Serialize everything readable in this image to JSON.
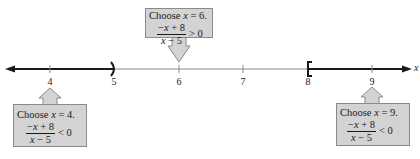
{
  "number_line": {
    "variable": "x",
    "ticks": [
      {
        "value": "4",
        "x": 50
      },
      {
        "value": "5",
        "x": 114
      },
      {
        "value": "6",
        "x": 179
      },
      {
        "value": "7",
        "x": 243
      },
      {
        "value": "8",
        "x": 308
      },
      {
        "value": "9",
        "x": 372
      }
    ],
    "solution": [
      {
        "interval": "(-∞, 5)",
        "endpoint": "5",
        "endpoint_type": "open parenthesis"
      },
      {
        "interval": "[8, ∞)",
        "endpoint": "8",
        "endpoint_type": "closed bracket"
      }
    ],
    "colors": {
      "axis": "#8a8a8a",
      "shaded": "#1a1a1a",
      "callout_fill": "#d3d3d3",
      "callout_border": "#8a8a8a"
    }
  },
  "callouts": [
    {
      "id": "test-6",
      "choose_prefix": "Choose ",
      "var": "x",
      "choose_suffix": " = 6.",
      "numerator_prefix": "−",
      "numerator_var": "x",
      "numerator_suffix": " + 8",
      "denominator_var": "x",
      "denominator_suffix": " − 5",
      "relation": "> 0"
    },
    {
      "id": "test-4",
      "choose_prefix": "Choose ",
      "var": "x",
      "choose_suffix": " = 4.",
      "numerator_prefix": "−",
      "numerator_var": "x",
      "numerator_suffix": " + 8",
      "denominator_var": "x",
      "denominator_suffix": " − 5",
      "relation": "< 0"
    },
    {
      "id": "test-9",
      "choose_prefix": "Choose ",
      "var": "x",
      "choose_suffix": " = 9.",
      "numerator_prefix": "−",
      "numerator_var": "x",
      "numerator_suffix": " + 8",
      "denominator_var": "x",
      "denominator_suffix": " − 5",
      "relation": "< 0"
    }
  ]
}
